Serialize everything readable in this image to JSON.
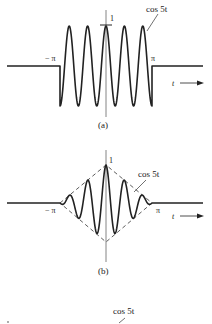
{
  "figure_a": {
    "caption": "(a)",
    "curve_label": "cos 5t",
    "peak_label": "1",
    "left_label": "− π",
    "right_label": "π",
    "axis_label": "t"
  },
  "figure_b": {
    "caption": "(b)",
    "curve_label": "cos 5t",
    "peak_label": "1",
    "left_label": "− π",
    "right_label": "π",
    "axis_label": "t"
  },
  "figure_c": {
    "curve_label": "cos 5t"
  },
  "colors": {
    "ink": "#222222",
    "axis": "#555555",
    "background": "#ffffff"
  }
}
